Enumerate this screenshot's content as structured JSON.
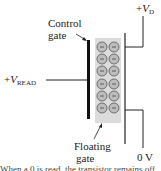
{
  "diagram": {
    "type": "floating-gate transistor read operation",
    "labels": {
      "control_gate_line1": "Control",
      "control_gate_line2": "gate",
      "floating_gate_line1": "Floating",
      "floating_gate_line2": "gate",
      "vread_prefix": "+",
      "vread_v": "V",
      "vread_sub": "READ",
      "vd_prefix": "+",
      "vd_v": "V",
      "vd_sub": "D",
      "ground": "0 V"
    },
    "caption_fragment": "When a 0 is read, the transistor remains off",
    "electrons": {
      "rows": 6,
      "columns": 2,
      "symbol": "−"
    },
    "colors": {
      "lines": "#111111",
      "floating_gate": "#dcdcdc",
      "electron_fill": "#bdbdbd",
      "electron_stroke": "#555555"
    }
  }
}
